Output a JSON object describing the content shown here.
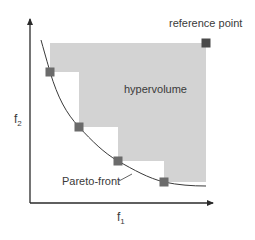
{
  "diagram": {
    "title": "",
    "labels": {
      "reference_point": "reference point",
      "hypervolume": "hypervolume",
      "pareto_front": "Pareto-front",
      "x_axis": "f",
      "x_axis_sub": "1",
      "y_axis": "f",
      "y_axis_sub": "2"
    },
    "colors": {
      "region_fill": "#d3d3d3",
      "point_fill": "#6b6b6b",
      "reference_fill": "#4a4a4a",
      "axis": "#2a2a2a",
      "curve": "#3a3a3a",
      "text": "#3a3a3a"
    },
    "pareto_points": [
      {
        "x": 50,
        "y": 72
      },
      {
        "x": 79,
        "y": 127
      },
      {
        "x": 118,
        "y": 161
      },
      {
        "x": 164,
        "y": 182
      }
    ],
    "reference_point": {
      "x": 206,
      "y": 43
    }
  }
}
